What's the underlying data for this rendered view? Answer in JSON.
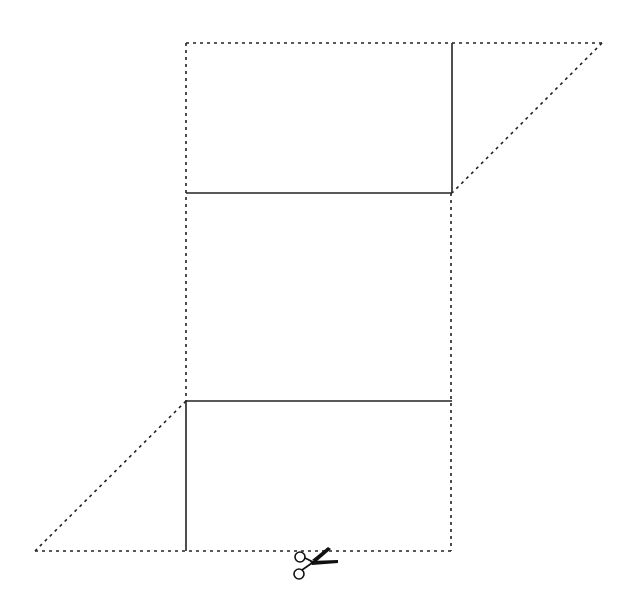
{
  "diagram": {
    "width": 640,
    "height": 608,
    "colors": {
      "line": "#222222",
      "background": "#ffffff"
    },
    "cut_lines_dotted": [
      {
        "name": "top-edge",
        "x1": 186,
        "y1": 43,
        "x2": 602,
        "y2": 43
      },
      {
        "name": "top-right-diagonal",
        "x1": 602,
        "y1": 43,
        "x2": 452,
        "y2": 193
      },
      {
        "name": "left-edge",
        "x1": 186,
        "y1": 43,
        "x2": 186,
        "y2": 401
      },
      {
        "name": "right-edge",
        "x1": 451,
        "y1": 193,
        "x2": 451,
        "y2": 551
      },
      {
        "name": "bottom-left-diagonal",
        "x1": 186,
        "y1": 401,
        "x2": 35,
        "y2": 551
      },
      {
        "name": "bottom-edge",
        "x1": 35,
        "y1": 551,
        "x2": 451,
        "y2": 551
      }
    ],
    "fold_lines_solid": [
      {
        "name": "top-vertical-fold",
        "x1": 452,
        "y1": 43,
        "x2": 452,
        "y2": 193
      },
      {
        "name": "upper-horizontal-fold",
        "x1": 186,
        "y1": 193,
        "x2": 452,
        "y2": 193
      },
      {
        "name": "lower-horizontal-fold",
        "x1": 186,
        "y1": 401,
        "x2": 452,
        "y2": 401
      },
      {
        "name": "bottom-vertical-fold",
        "x1": 186,
        "y1": 401,
        "x2": 186,
        "y2": 551
      }
    ],
    "scissors": {
      "icon": "scissors-icon",
      "x": 293,
      "y": 548
    }
  }
}
